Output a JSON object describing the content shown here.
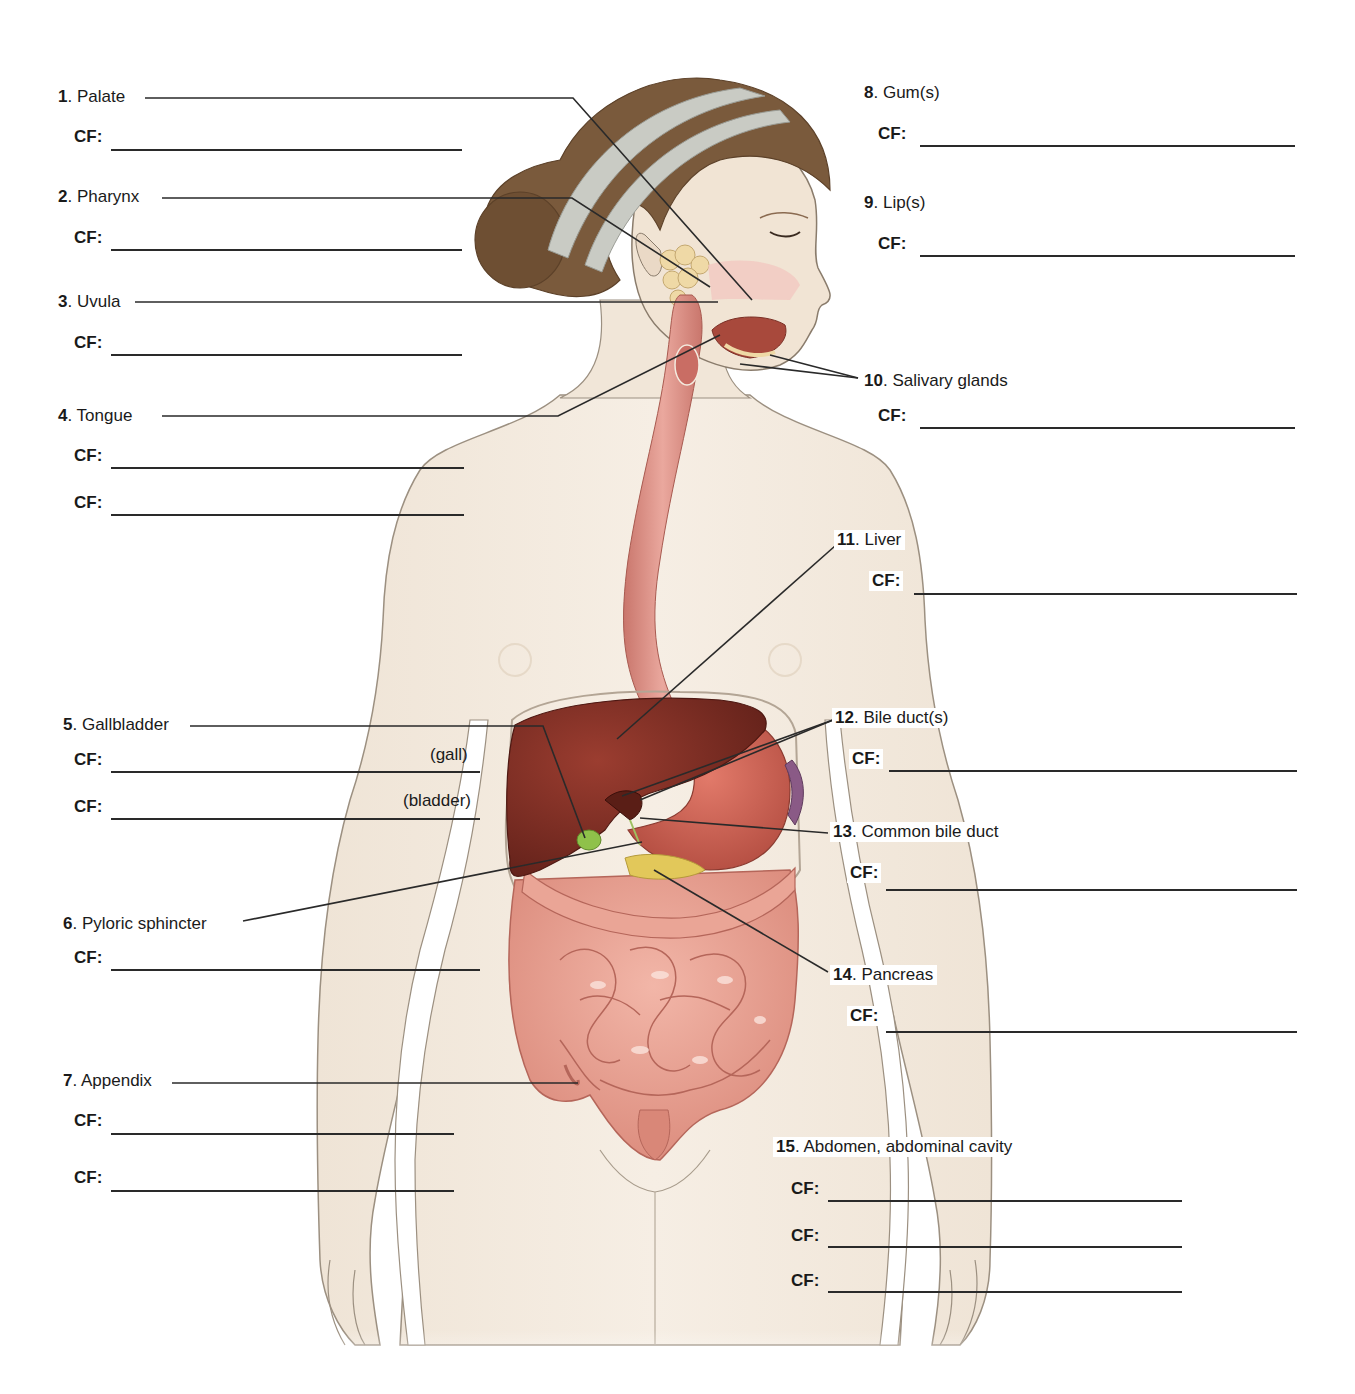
{
  "worksheet": {
    "cf_prefix": "CF:",
    "items": [
      {
        "num": "1",
        "label": "Palate",
        "side": "left"
      },
      {
        "num": "2",
        "label": "Pharynx",
        "side": "left"
      },
      {
        "num": "3",
        "label": "Uvula",
        "side": "left"
      },
      {
        "num": "4",
        "label": "Tongue",
        "side": "left"
      },
      {
        "num": "5",
        "label": "Gallbladder",
        "side": "left",
        "blank_hints": [
          "(gall)",
          "(bladder)"
        ]
      },
      {
        "num": "6",
        "label": "Pyloric sphincter",
        "side": "left"
      },
      {
        "num": "7",
        "label": "Appendix",
        "side": "left"
      },
      {
        "num": "8",
        "label": "Gum(s)",
        "side": "right"
      },
      {
        "num": "9",
        "label": "Lip(s)",
        "side": "right"
      },
      {
        "num": "10",
        "label": "Salivary glands",
        "side": "right"
      },
      {
        "num": "11",
        "label": "Liver",
        "side": "right"
      },
      {
        "num": "12",
        "label": "Bile duct(s)",
        "side": "right"
      },
      {
        "num": "13",
        "label": "Common bile duct",
        "side": "right"
      },
      {
        "num": "14",
        "label": "Pancreas",
        "side": "right"
      },
      {
        "num": "15",
        "label": "Abdomen, abdominal cavity",
        "side": "right"
      }
    ],
    "blank_counts": {
      "1": 1,
      "2": 1,
      "3": 1,
      "4": 2,
      "5": 2,
      "6": 1,
      "7": 2,
      "8": 1,
      "9": 1,
      "10": 1,
      "11": 1,
      "12": 1,
      "13": 1,
      "14": 1,
      "15": 3
    }
  },
  "illustration": {
    "subject": "female figure, front view, digestive system",
    "colors": {
      "skin": "#f4ebdf",
      "skin_outline": "#9c9081",
      "hair": "#7a5a3c",
      "headband": "#c9cbc4",
      "esophagus": "#e0948a",
      "liver": "#7a2b22",
      "stomach": "#c85a4e",
      "intestine": "#e8a293",
      "gallbladder": "#8fc14a",
      "pancreas": "#e2c85a",
      "spleen": "#8a5a86",
      "leader_line": "#2a2a2a"
    }
  }
}
